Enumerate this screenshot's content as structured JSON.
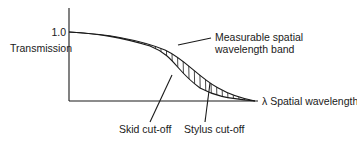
{
  "diagram": {
    "y_axis_label": "Transmission",
    "y_tick_label": "1.0",
    "x_axis_label": "λ Spatial wavelength",
    "band_label_line1": "Measurable spatial",
    "band_label_line2": "wavelength band",
    "skid_label": "Skid cut-off",
    "stylus_label": "Stylus cut-off",
    "colors": {
      "ink": "#1a1a1a",
      "background": "#ffffff"
    }
  }
}
